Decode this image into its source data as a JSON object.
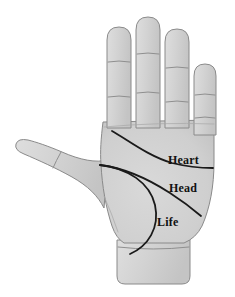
{
  "diagram": {
    "background_color": "#ffffff",
    "skin_fill_color": "#d2d2d2",
    "skin_fill_color_light": "#dcdcdc",
    "skin_fill_color_shadow": "#bdbdbd",
    "outline_color": "#8a8a8a",
    "crease_color": "#8f8f8f",
    "palm_line_color": "#1a1a1a",
    "label_color": "#111111"
  },
  "labels": {
    "heart": "Heart",
    "head": "Head",
    "life": "Life"
  },
  "palm_lines": [
    {
      "id": "heart",
      "label": "Heart",
      "description": "upper curved line running from below the index finger across to the outer palm edge",
      "path": "M 112 131 C 128 140, 148 156, 172 163 C 188 167, 202 168, 213 168"
    },
    {
      "id": "head",
      "label": "Head",
      "description": "middle line running from the thumb web diagonally down to the lower outer palm",
      "path": "M 100 165 C 124 168, 150 180, 170 193 C 184 202, 194 210, 201 216"
    },
    {
      "id": "life",
      "label": "Life",
      "description": "arc curving around the base of the thumb down toward the wrist",
      "path": "M 100 165 C 128 168, 150 183, 155 205 C 160 228, 148 246, 130 254"
    }
  ],
  "fingers": [
    {
      "id": "index",
      "name": "Index finger",
      "creases": 2
    },
    {
      "id": "middle",
      "name": "Middle finger",
      "creases": 2
    },
    {
      "id": "ring",
      "name": "Ring finger",
      "creases": 2
    },
    {
      "id": "pinky",
      "name": "Little finger",
      "creases": 2
    },
    {
      "id": "thumb",
      "name": "Thumb",
      "creases": 1
    }
  ],
  "parts": {
    "palm": "Palm",
    "wrist": "Wrist",
    "thenar": "Thumb mound"
  }
}
